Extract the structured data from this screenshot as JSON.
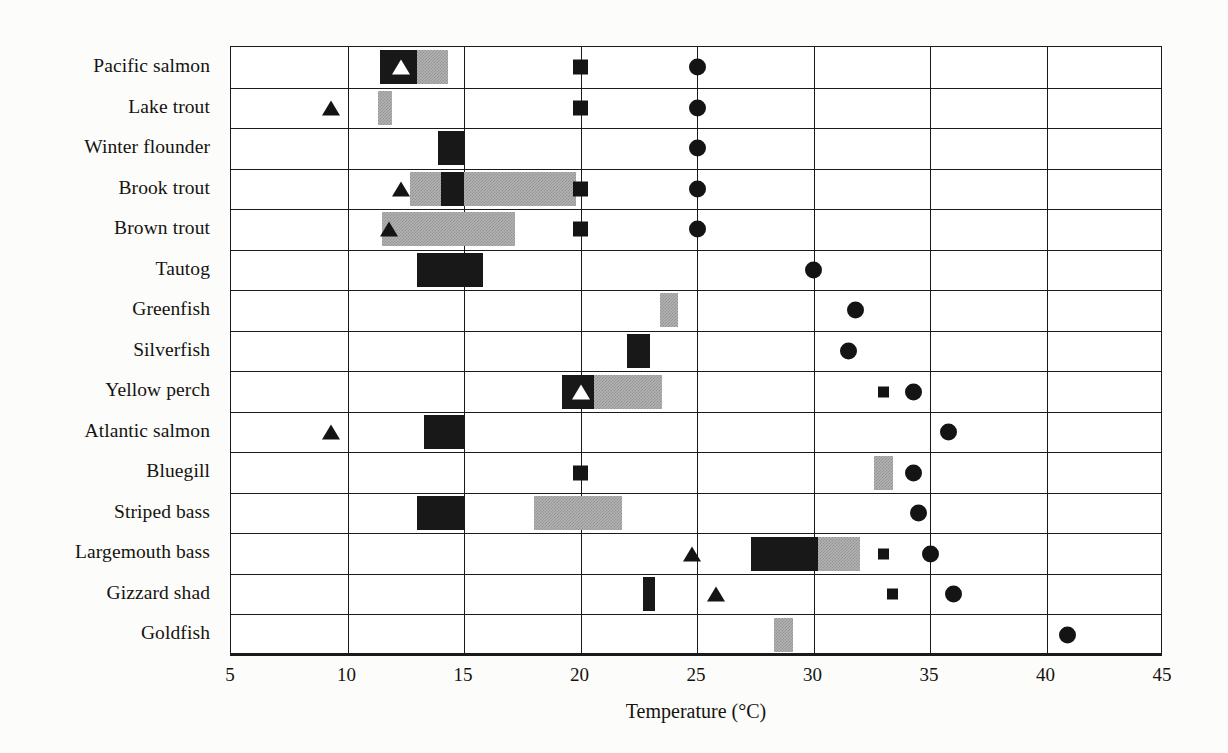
{
  "chart_data": {
    "type": "bar",
    "title": "",
    "xlabel": "Temperature (°C)",
    "ylabel": "",
    "xlim": [
      5,
      45
    ],
    "xticks": [
      5,
      10,
      15,
      20,
      25,
      30,
      35,
      40,
      45
    ],
    "grid": true,
    "legend": "none",
    "orientation": "horizontal",
    "categories": [
      "Pacific salmon",
      "Lake trout",
      "Winter flounder",
      "Brook trout",
      "Brown trout",
      "Tautog",
      "Greenfish",
      "Silverfish",
      "Yellow perch",
      "Atlantic salmon",
      "Bluegill",
      "Striped bass",
      "Largemouth bass",
      "Gizzard shad",
      "Goldfish"
    ],
    "marker_types": {
      "black-bar": "preferred/optimum temperature range (solid)",
      "gray-bar": "secondary temperature range (shaded)",
      "triangle": "spawning temperature",
      "white-triangle": "spawning temperature (overlapping band)",
      "square": "growth/stress temperature",
      "circle": "upper lethal temperature"
    },
    "rows": [
      {
        "category": "Pacific salmon",
        "bars": [
          {
            "style": "black",
            "start": 11.4,
            "end": 13.0
          },
          {
            "style": "gray",
            "start": 13.0,
            "end": 14.3
          }
        ],
        "markers": [
          {
            "type": "white-triangle",
            "value": 12.3
          },
          {
            "type": "square",
            "value": 20.0
          },
          {
            "type": "circle",
            "value": 25.0
          }
        ]
      },
      {
        "category": "Lake trout",
        "bars": [
          {
            "style": "gray",
            "start": 11.3,
            "end": 11.9
          }
        ],
        "markers": [
          {
            "type": "triangle",
            "value": 9.3
          },
          {
            "type": "square",
            "value": 20.0
          },
          {
            "type": "circle",
            "value": 25.0
          }
        ]
      },
      {
        "category": "Winter flounder",
        "bars": [
          {
            "style": "black",
            "start": 13.9,
            "end": 15.0
          }
        ],
        "markers": [
          {
            "type": "circle",
            "value": 25.0
          }
        ]
      },
      {
        "category": "Brook trout",
        "bars": [
          {
            "style": "gray",
            "start": 12.7,
            "end": 14.0
          },
          {
            "style": "black",
            "start": 14.0,
            "end": 15.0
          },
          {
            "style": "gray",
            "start": 15.0,
            "end": 19.8
          }
        ],
        "markers": [
          {
            "type": "triangle",
            "value": 12.3
          },
          {
            "type": "square",
            "value": 20.0
          },
          {
            "type": "circle",
            "value": 25.0
          }
        ]
      },
      {
        "category": "Brown trout",
        "bars": [
          {
            "style": "gray",
            "start": 11.5,
            "end": 17.2
          }
        ],
        "markers": [
          {
            "type": "triangle",
            "value": 11.8
          },
          {
            "type": "square",
            "value": 20.0
          },
          {
            "type": "circle",
            "value": 25.0
          }
        ]
      },
      {
        "category": "Tautog",
        "bars": [
          {
            "style": "black",
            "start": 13.0,
            "end": 15.8
          }
        ],
        "markers": [
          {
            "type": "circle",
            "value": 30.0
          }
        ]
      },
      {
        "category": "Greenfish",
        "bars": [
          {
            "style": "gray",
            "start": 23.4,
            "end": 24.2
          }
        ],
        "markers": [
          {
            "type": "circle",
            "value": 31.8
          }
        ]
      },
      {
        "category": "Silverfish",
        "bars": [
          {
            "style": "black",
            "start": 22.0,
            "end": 23.0
          }
        ],
        "markers": [
          {
            "type": "circle",
            "value": 31.5
          }
        ]
      },
      {
        "category": "Yellow perch",
        "bars": [
          {
            "style": "black",
            "start": 19.2,
            "end": 20.6
          },
          {
            "style": "gray",
            "start": 20.6,
            "end": 23.5
          }
        ],
        "markers": [
          {
            "type": "white-triangle",
            "value": 20.0
          },
          {
            "type": "square",
            "value": 33.0
          },
          {
            "type": "circle",
            "value": 34.3
          }
        ]
      },
      {
        "category": "Atlantic salmon",
        "bars": [
          {
            "style": "black",
            "start": 13.3,
            "end": 15.0
          }
        ],
        "markers": [
          {
            "type": "triangle",
            "value": 9.3
          },
          {
            "type": "circle",
            "value": 35.8
          }
        ]
      },
      {
        "category": "Bluegill",
        "bars": [
          {
            "style": "gray",
            "start": 32.6,
            "end": 33.4
          }
        ],
        "markers": [
          {
            "type": "square",
            "value": 20.0
          },
          {
            "type": "circle",
            "value": 34.3
          }
        ]
      },
      {
        "category": "Striped bass",
        "bars": [
          {
            "style": "black",
            "start": 13.0,
            "end": 15.0
          },
          {
            "style": "gray",
            "start": 18.0,
            "end": 21.8
          }
        ],
        "markers": [
          {
            "type": "circle",
            "value": 34.5
          }
        ]
      },
      {
        "category": "Largemouth bass",
        "bars": [
          {
            "style": "black",
            "start": 27.3,
            "end": 30.2
          },
          {
            "style": "gray",
            "start": 30.2,
            "end": 32.0
          }
        ],
        "markers": [
          {
            "type": "triangle",
            "value": 24.8
          },
          {
            "type": "square",
            "value": 33.0
          },
          {
            "type": "circle",
            "value": 35.0
          }
        ]
      },
      {
        "category": "Gizzard shad",
        "bars": [
          {
            "style": "black",
            "start": 22.7,
            "end": 23.2
          }
        ],
        "markers": [
          {
            "type": "triangle",
            "value": 25.8
          },
          {
            "type": "square",
            "value": 33.4
          },
          {
            "type": "circle",
            "value": 36.0
          }
        ]
      },
      {
        "category": "Goldfish",
        "bars": [
          {
            "style": "gray",
            "start": 28.3,
            "end": 29.1
          }
        ],
        "markers": [
          {
            "type": "circle",
            "value": 40.9
          }
        ]
      }
    ],
    "colors": {
      "bar_solid": "#181818",
      "bar_shaded": "#b2b2b2",
      "axis": "#1a1a1a",
      "text": "#15130f",
      "background": "#ffffff"
    }
  }
}
